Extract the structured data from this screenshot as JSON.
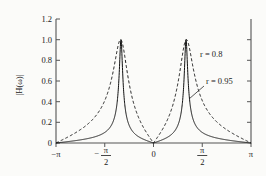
{
  "figure": {
    "background_color": "#fbfbf9",
    "axis_color": "#555555",
    "curve_color": "#111111"
  },
  "chart_data": {
    "type": "line",
    "title": "",
    "subtitle": "",
    "xlabel": "",
    "ylabel": "|H(ω)|",
    "xlim": [
      -3.14159265,
      3.14159265
    ],
    "ylim": [
      0,
      1.2
    ],
    "grid": false,
    "legend_position": "inline-annotation",
    "x_tick_labels": [
      "−π",
      "−π/2",
      "0",
      "π/2",
      "π"
    ],
    "x_tick_values": [
      -3.14159265,
      -1.57079633,
      0,
      1.57079633,
      3.14159265
    ],
    "y_tick_labels": [
      "0",
      "0.2",
      "0.4",
      "0.6",
      "0.8",
      "1.0",
      "1.2"
    ],
    "y_tick_values": [
      0,
      0.2,
      0.4,
      0.6,
      0.8,
      1.0,
      1.2
    ],
    "peak_frequencies": [
      -1.0472,
      1.0472
    ],
    "peak_value": 1.0,
    "series": [
      {
        "name": "r = 0.8",
        "style": "dashed",
        "r": 0.8,
        "omega0": 1.0472,
        "peak_value": 1.0,
        "description": "Broad resonance peaks at ω = ±π/3, wider bandwidth"
      },
      {
        "name": "r = 0.95",
        "style": "solid",
        "r": 0.95,
        "omega0": 1.0472,
        "peak_value": 1.0,
        "description": "Sharp narrow resonance peaks at ω = ±π/3, narrow bandwidth"
      }
    ]
  },
  "annotations": {
    "label_r08": "r = 0.8",
    "label_r095": "r = 0.95"
  },
  "axis_labels": {
    "y_title": "|H(ω)|",
    "y_title_parts": {
      "bar_left": "|",
      "h": "H",
      "omega": "(ω)",
      "bar_right": "|"
    },
    "y_0": "0",
    "y_02": "0.2",
    "y_04": "0.4",
    "y_06": "0.6",
    "y_08": "0.8",
    "y_10": "1.0",
    "y_12": "1.2",
    "x_neg_pi": "−π",
    "x_neg_half_num": "π",
    "x_neg_half_den": "2",
    "x_neg_half_sign": "−",
    "x_zero": "0",
    "x_half_num": "π",
    "x_half_den": "2",
    "x_pi": "π"
  }
}
